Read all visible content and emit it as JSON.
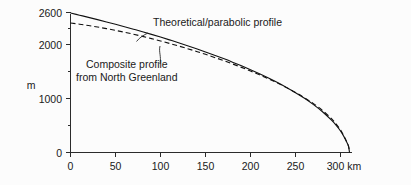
{
  "chart_data": {
    "type": "line",
    "title": "",
    "subtitle": "",
    "xlabel": "",
    "ylabel": "m",
    "x_unit_label": "300 km",
    "xlim": [
      0,
      320
    ],
    "ylim": [
      0,
      2700
    ],
    "grid": false,
    "legend_position": "inline-annotations",
    "x_ticks": [
      0,
      50,
      100,
      150,
      200,
      250,
      300
    ],
    "x_tick_labels": [
      "0",
      "50",
      "100",
      "150",
      "200",
      "250",
      "300 km"
    ],
    "y_ticks": [
      0,
      1000,
      2000,
      2600
    ],
    "y_tick_labels": [
      "0",
      "1000",
      "2000",
      "2600"
    ],
    "y_minor_ticks": [
      500,
      1500,
      2500
    ],
    "series": [
      {
        "name": "Theoretical/parabolic profile",
        "style": "solid",
        "color": "#111111",
        "x": [
          0,
          10,
          20,
          30,
          40,
          50,
          60,
          70,
          80,
          90,
          100,
          110,
          120,
          130,
          140,
          150,
          160,
          170,
          180,
          190,
          200,
          210,
          220,
          230,
          240,
          250,
          260,
          270,
          280,
          290,
          295,
          300,
          304,
          307,
          309,
          310
        ],
        "y": [
          2590,
          2550,
          2510,
          2468,
          2425,
          2381,
          2336,
          2290,
          2243,
          2194,
          2144,
          2092,
          2039,
          1984,
          1927,
          1868,
          1807,
          1744,
          1678,
          1609,
          1537,
          1462,
          1382,
          1298,
          1208,
          1111,
          1006,
          889,
          757,
          600,
          508,
          400,
          290,
          190,
          110,
          0
        ]
      },
      {
        "name": "Composite profile from North Greenland",
        "style": "dashed",
        "color": "#111111",
        "x": [
          0,
          10,
          20,
          30,
          40,
          50,
          60,
          70,
          80,
          90,
          100,
          110,
          120,
          130,
          140,
          150,
          160,
          170,
          180,
          190,
          200,
          210,
          220,
          230,
          240,
          250,
          260,
          270,
          280,
          290,
          295,
          300,
          304,
          307,
          309,
          310
        ],
        "y": [
          2405,
          2383,
          2358,
          2330,
          2300,
          2268,
          2233,
          2196,
          2157,
          2115,
          2072,
          2026,
          1979,
          1929,
          1877,
          1823,
          1766,
          1707,
          1645,
          1581,
          1513,
          1442,
          1368,
          1289,
          1205,
          1115,
          1017,
          908,
          782,
          628,
          533,
          420,
          300,
          195,
          112,
          0
        ]
      }
    ],
    "annotations": [
      {
        "id": "theoretical-label",
        "text": "Theoretical/parabolic profile",
        "target_x": 84,
        "target_y": 2250
      },
      {
        "id": "composite-label",
        "line1": "Composite profile",
        "line2": "from North Greenland",
        "target_x": 112,
        "target_y": 2010
      }
    ]
  },
  "figure": {
    "background_color": "#fcfcfc",
    "ink_color": "#111111"
  }
}
